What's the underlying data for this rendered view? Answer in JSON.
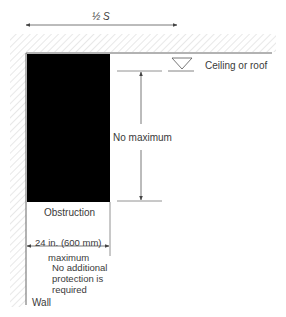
{
  "diagram": {
    "half_s_label": "½ S",
    "ceiling_label": "Ceiling or roof",
    "no_max_label": "No maximum",
    "obstruction_label": "Obstruction",
    "width_label": "24 in. (600 mm)",
    "width_sublabel": "maximum",
    "note_lines": [
      "No additional",
      "protection is",
      "required"
    ],
    "wall_label": "Wall"
  },
  "colors": {
    "obstruction": "#000000",
    "line": "#555555",
    "hatch": "#d8d8d8"
  }
}
